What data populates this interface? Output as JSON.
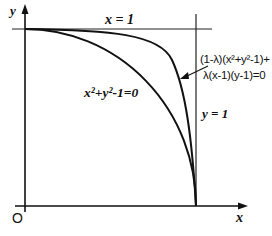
{
  "diagram": {
    "type": "function-plot",
    "axes": {
      "x_label": "x",
      "y_label": "y",
      "origin_label": "O"
    },
    "lines": [
      {
        "id": "horizontal",
        "label": "x = 1"
      },
      {
        "id": "vertical",
        "label": "y = 1"
      }
    ],
    "curves": [
      {
        "id": "circle",
        "label": "x²+y²-1=0"
      },
      {
        "id": "blend",
        "label_line1": "(1-λ)(x²+y²-1)+",
        "label_line2": "λ(x-1)(y-1)=0"
      }
    ],
    "labels": {
      "x_axis": "x",
      "y_axis": "y",
      "origin": "O",
      "top_line": "x = 1",
      "right_line": "y = 1",
      "circle_eq": "x²+y²-1=0",
      "blend_eq_1": "(1-λ)(x²+y²-1)+",
      "blend_eq_2": "λ(x-1)(y-1)=0"
    }
  }
}
